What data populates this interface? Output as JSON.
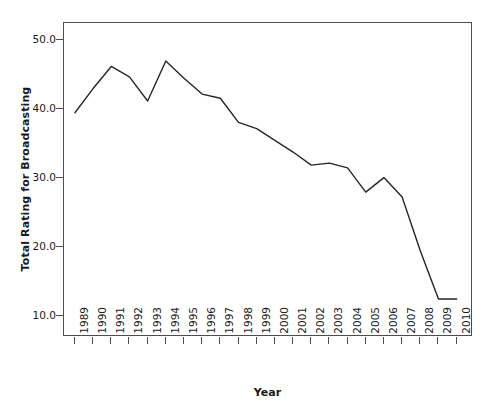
{
  "chart_data": {
    "type": "line",
    "title": "",
    "xlabel": "Year",
    "ylabel": "Total Rating for Broadcasting",
    "x": [
      1989,
      1990,
      1991,
      1992,
      1993,
      1994,
      1995,
      1996,
      1997,
      1998,
      1999,
      2000,
      2001,
      2002,
      2003,
      2004,
      2005,
      2006,
      2007,
      2008,
      2009,
      2010
    ],
    "categories": [
      "1989",
      "1990",
      "1991",
      "1992",
      "1993",
      "1994",
      "1995",
      "1996",
      "1997",
      "1998",
      "1999",
      "2000",
      "2001",
      "2002",
      "2003",
      "2004",
      "2005",
      "2006",
      "2007",
      "2008",
      "2009",
      "2010"
    ],
    "values": [
      39.5,
      43.0,
      46.2,
      44.7,
      41.2,
      47.0,
      44.5,
      42.2,
      41.6,
      38.1,
      37.2,
      35.5,
      33.8,
      31.9,
      32.2,
      31.5,
      28.0,
      30.1,
      27.3,
      19.5,
      12.5,
      12.5
    ],
    "series": [
      {
        "name": "Total Rating for Broadcasting",
        "color": "#262626",
        "values": [
          39.5,
          43.0,
          46.2,
          44.7,
          41.2,
          47.0,
          44.5,
          42.2,
          41.6,
          38.1,
          37.2,
          35.5,
          33.8,
          31.9,
          32.2,
          31.5,
          28.0,
          30.1,
          27.3,
          19.5,
          12.5,
          12.5
        ]
      }
    ],
    "ylim": [
      7.0,
      52.5
    ],
    "xlim": [
      1988.4,
      2010.9
    ],
    "yticks": [
      10.0,
      20.0,
      30.0,
      40.0,
      50.0
    ],
    "ytick_labels": [
      "10.0",
      "20.0",
      "30.0",
      "40.0",
      "50.0"
    ],
    "grid": false,
    "legend": false,
    "legend_position": "none",
    "line_color": "#262626",
    "line_width": 1.4,
    "frame_color": "#4d4d4d",
    "background": "#ffffff"
  }
}
